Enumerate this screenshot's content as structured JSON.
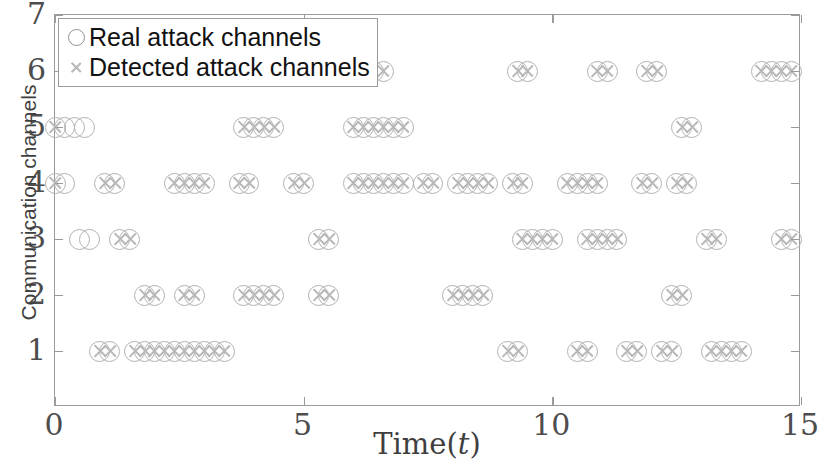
{
  "chart_data": {
    "type": "scatter",
    "title": "",
    "xlabel": "Time(t)",
    "ylabel": "Communication channels",
    "xlim": [
      0,
      15
    ],
    "ylim": [
      0,
      7
    ],
    "xticks": [
      0,
      5,
      10,
      15
    ],
    "yticks": [
      1,
      2,
      3,
      4,
      5,
      6,
      7
    ],
    "grid": false,
    "legend_position": "top-left",
    "legend": [
      {
        "name": "Real attack channels",
        "marker": "circle"
      },
      {
        "name": "Detected attack channels",
        "marker": "x"
      }
    ],
    "series": [
      {
        "name": "Real attack channels",
        "marker": "circle",
        "color": "#b2b2b2",
        "points": [
          {
            "x": 0.0,
            "y": 5
          },
          {
            "x": 0.2,
            "y": 5
          },
          {
            "x": 0.4,
            "y": 5
          },
          {
            "x": 0.6,
            "y": 5
          },
          {
            "x": 0.0,
            "y": 4
          },
          {
            "x": 0.2,
            "y": 4
          },
          {
            "x": 0.5,
            "y": 3
          },
          {
            "x": 0.7,
            "y": 3
          },
          {
            "x": 1.3,
            "y": 3
          },
          {
            "x": 1.5,
            "y": 3
          },
          {
            "x": 0.9,
            "y": 1
          },
          {
            "x": 1.1,
            "y": 1
          },
          {
            "x": 1.0,
            "y": 4
          },
          {
            "x": 1.2,
            "y": 4
          },
          {
            "x": 1.8,
            "y": 2
          },
          {
            "x": 2.0,
            "y": 2
          },
          {
            "x": 1.6,
            "y": 1
          },
          {
            "x": 1.8,
            "y": 1
          },
          {
            "x": 2.0,
            "y": 1
          },
          {
            "x": 2.2,
            "y": 1
          },
          {
            "x": 2.4,
            "y": 1
          },
          {
            "x": 2.6,
            "y": 1
          },
          {
            "x": 2.8,
            "y": 1
          },
          {
            "x": 3.0,
            "y": 1
          },
          {
            "x": 3.2,
            "y": 1
          },
          {
            "x": 3.4,
            "y": 1
          },
          {
            "x": 2.4,
            "y": 4
          },
          {
            "x": 2.6,
            "y": 4
          },
          {
            "x": 2.8,
            "y": 4
          },
          {
            "x": 3.0,
            "y": 4
          },
          {
            "x": 2.6,
            "y": 2
          },
          {
            "x": 2.8,
            "y": 2
          },
          {
            "x": 3.8,
            "y": 5
          },
          {
            "x": 4.0,
            "y": 5
          },
          {
            "x": 4.2,
            "y": 5
          },
          {
            "x": 4.4,
            "y": 5
          },
          {
            "x": 3.7,
            "y": 4
          },
          {
            "x": 3.9,
            "y": 4
          },
          {
            "x": 3.8,
            "y": 2
          },
          {
            "x": 4.0,
            "y": 2
          },
          {
            "x": 4.2,
            "y": 2
          },
          {
            "x": 4.4,
            "y": 2
          },
          {
            "x": 5.5,
            "y": 6
          },
          {
            "x": 5.7,
            "y": 6
          },
          {
            "x": 4.8,
            "y": 4
          },
          {
            "x": 5.0,
            "y": 4
          },
          {
            "x": 5.3,
            "y": 3
          },
          {
            "x": 5.5,
            "y": 3
          },
          {
            "x": 5.3,
            "y": 2
          },
          {
            "x": 5.5,
            "y": 2
          },
          {
            "x": 6.4,
            "y": 6
          },
          {
            "x": 6.6,
            "y": 6
          },
          {
            "x": 6.0,
            "y": 5
          },
          {
            "x": 6.2,
            "y": 5
          },
          {
            "x": 6.4,
            "y": 5
          },
          {
            "x": 6.6,
            "y": 5
          },
          {
            "x": 6.8,
            "y": 5
          },
          {
            "x": 7.0,
            "y": 5
          },
          {
            "x": 6.0,
            "y": 4
          },
          {
            "x": 6.2,
            "y": 4
          },
          {
            "x": 6.4,
            "y": 4
          },
          {
            "x": 6.6,
            "y": 4
          },
          {
            "x": 6.8,
            "y": 4
          },
          {
            "x": 7.0,
            "y": 4
          },
          {
            "x": 7.4,
            "y": 4
          },
          {
            "x": 7.6,
            "y": 4
          },
          {
            "x": 8.1,
            "y": 4
          },
          {
            "x": 8.3,
            "y": 4
          },
          {
            "x": 8.5,
            "y": 4
          },
          {
            "x": 8.7,
            "y": 4
          },
          {
            "x": 8.0,
            "y": 2
          },
          {
            "x": 8.2,
            "y": 2
          },
          {
            "x": 8.4,
            "y": 2
          },
          {
            "x": 8.6,
            "y": 2
          },
          {
            "x": 9.3,
            "y": 6
          },
          {
            "x": 9.5,
            "y": 6
          },
          {
            "x": 9.2,
            "y": 4
          },
          {
            "x": 9.4,
            "y": 4
          },
          {
            "x": 9.4,
            "y": 3
          },
          {
            "x": 9.6,
            "y": 3
          },
          {
            "x": 9.8,
            "y": 3
          },
          {
            "x": 10.0,
            "y": 3
          },
          {
            "x": 9.1,
            "y": 1
          },
          {
            "x": 9.3,
            "y": 1
          },
          {
            "x": 10.9,
            "y": 6
          },
          {
            "x": 11.1,
            "y": 6
          },
          {
            "x": 10.3,
            "y": 4
          },
          {
            "x": 10.5,
            "y": 4
          },
          {
            "x": 10.7,
            "y": 4
          },
          {
            "x": 10.9,
            "y": 4
          },
          {
            "x": 10.7,
            "y": 3
          },
          {
            "x": 10.9,
            "y": 3
          },
          {
            "x": 11.1,
            "y": 3
          },
          {
            "x": 11.3,
            "y": 3
          },
          {
            "x": 10.5,
            "y": 1
          },
          {
            "x": 10.7,
            "y": 1
          },
          {
            "x": 11.9,
            "y": 6
          },
          {
            "x": 12.1,
            "y": 6
          },
          {
            "x": 11.8,
            "y": 4
          },
          {
            "x": 12.0,
            "y": 4
          },
          {
            "x": 11.5,
            "y": 1
          },
          {
            "x": 11.7,
            "y": 1
          },
          {
            "x": 12.2,
            "y": 1
          },
          {
            "x": 12.4,
            "y": 1
          },
          {
            "x": 12.6,
            "y": 5
          },
          {
            "x": 12.8,
            "y": 5
          },
          {
            "x": 12.5,
            "y": 4
          },
          {
            "x": 12.7,
            "y": 4
          },
          {
            "x": 12.4,
            "y": 2
          },
          {
            "x": 12.6,
            "y": 2
          },
          {
            "x": 13.1,
            "y": 3
          },
          {
            "x": 13.3,
            "y": 3
          },
          {
            "x": 13.2,
            "y": 1
          },
          {
            "x": 13.4,
            "y": 1
          },
          {
            "x": 13.6,
            "y": 1
          },
          {
            "x": 13.8,
            "y": 1
          },
          {
            "x": 14.2,
            "y": 6
          },
          {
            "x": 14.4,
            "y": 6
          },
          {
            "x": 14.6,
            "y": 6
          },
          {
            "x": 14.8,
            "y": 6
          },
          {
            "x": 14.6,
            "y": 3
          },
          {
            "x": 14.8,
            "y": 3
          }
        ]
      },
      {
        "name": "Detected attack channels",
        "marker": "x",
        "color": "#b8b8b8",
        "points": [
          {
            "x": 0.0,
            "y": 5
          },
          {
            "x": 0.0,
            "y": 4
          },
          {
            "x": 1.3,
            "y": 3
          },
          {
            "x": 1.5,
            "y": 3
          },
          {
            "x": 0.9,
            "y": 1
          },
          {
            "x": 1.1,
            "y": 1
          },
          {
            "x": 1.0,
            "y": 4
          },
          {
            "x": 1.2,
            "y": 4
          },
          {
            "x": 1.8,
            "y": 2
          },
          {
            "x": 2.0,
            "y": 2
          },
          {
            "x": 1.6,
            "y": 1
          },
          {
            "x": 1.8,
            "y": 1
          },
          {
            "x": 2.0,
            "y": 1
          },
          {
            "x": 2.2,
            "y": 1
          },
          {
            "x": 2.4,
            "y": 1
          },
          {
            "x": 2.6,
            "y": 1
          },
          {
            "x": 2.8,
            "y": 1
          },
          {
            "x": 3.0,
            "y": 1
          },
          {
            "x": 3.2,
            "y": 1
          },
          {
            "x": 3.4,
            "y": 1
          },
          {
            "x": 2.4,
            "y": 4
          },
          {
            "x": 2.6,
            "y": 4
          },
          {
            "x": 2.8,
            "y": 4
          },
          {
            "x": 3.0,
            "y": 4
          },
          {
            "x": 2.6,
            "y": 2
          },
          {
            "x": 2.8,
            "y": 2
          },
          {
            "x": 3.8,
            "y": 5
          },
          {
            "x": 4.0,
            "y": 5
          },
          {
            "x": 4.2,
            "y": 5
          },
          {
            "x": 4.4,
            "y": 5
          },
          {
            "x": 3.7,
            "y": 4
          },
          {
            "x": 3.9,
            "y": 4
          },
          {
            "x": 3.8,
            "y": 2
          },
          {
            "x": 4.0,
            "y": 2
          },
          {
            "x": 4.2,
            "y": 2
          },
          {
            "x": 4.4,
            "y": 2
          },
          {
            "x": 5.5,
            "y": 6
          },
          {
            "x": 5.7,
            "y": 6
          },
          {
            "x": 4.8,
            "y": 4
          },
          {
            "x": 5.0,
            "y": 4
          },
          {
            "x": 5.3,
            "y": 3
          },
          {
            "x": 5.5,
            "y": 3
          },
          {
            "x": 5.3,
            "y": 2
          },
          {
            "x": 5.5,
            "y": 2
          },
          {
            "x": 6.4,
            "y": 6
          },
          {
            "x": 6.6,
            "y": 6
          },
          {
            "x": 6.0,
            "y": 5
          },
          {
            "x": 6.2,
            "y": 5
          },
          {
            "x": 6.4,
            "y": 5
          },
          {
            "x": 6.6,
            "y": 5
          },
          {
            "x": 6.8,
            "y": 5
          },
          {
            "x": 7.0,
            "y": 5
          },
          {
            "x": 6.0,
            "y": 4
          },
          {
            "x": 6.2,
            "y": 4
          },
          {
            "x": 6.4,
            "y": 4
          },
          {
            "x": 6.6,
            "y": 4
          },
          {
            "x": 6.8,
            "y": 4
          },
          {
            "x": 7.0,
            "y": 4
          },
          {
            "x": 7.4,
            "y": 4
          },
          {
            "x": 7.6,
            "y": 4
          },
          {
            "x": 8.1,
            "y": 4
          },
          {
            "x": 8.3,
            "y": 4
          },
          {
            "x": 8.5,
            "y": 4
          },
          {
            "x": 8.7,
            "y": 4
          },
          {
            "x": 8.0,
            "y": 2
          },
          {
            "x": 8.2,
            "y": 2
          },
          {
            "x": 8.4,
            "y": 2
          },
          {
            "x": 8.6,
            "y": 2
          },
          {
            "x": 9.3,
            "y": 6
          },
          {
            "x": 9.5,
            "y": 6
          },
          {
            "x": 9.2,
            "y": 4
          },
          {
            "x": 9.4,
            "y": 4
          },
          {
            "x": 9.4,
            "y": 3
          },
          {
            "x": 9.6,
            "y": 3
          },
          {
            "x": 9.8,
            "y": 3
          },
          {
            "x": 10.0,
            "y": 3
          },
          {
            "x": 9.1,
            "y": 1
          },
          {
            "x": 9.3,
            "y": 1
          },
          {
            "x": 10.9,
            "y": 6
          },
          {
            "x": 11.1,
            "y": 6
          },
          {
            "x": 10.3,
            "y": 4
          },
          {
            "x": 10.5,
            "y": 4
          },
          {
            "x": 10.7,
            "y": 4
          },
          {
            "x": 10.9,
            "y": 4
          },
          {
            "x": 10.7,
            "y": 3
          },
          {
            "x": 10.9,
            "y": 3
          },
          {
            "x": 11.1,
            "y": 3
          },
          {
            "x": 11.3,
            "y": 3
          },
          {
            "x": 10.5,
            "y": 1
          },
          {
            "x": 10.7,
            "y": 1
          },
          {
            "x": 11.9,
            "y": 6
          },
          {
            "x": 12.1,
            "y": 6
          },
          {
            "x": 11.8,
            "y": 4
          },
          {
            "x": 12.0,
            "y": 4
          },
          {
            "x": 11.5,
            "y": 1
          },
          {
            "x": 11.7,
            "y": 1
          },
          {
            "x": 12.2,
            "y": 1
          },
          {
            "x": 12.4,
            "y": 1
          },
          {
            "x": 12.6,
            "y": 5
          },
          {
            "x": 12.8,
            "y": 5
          },
          {
            "x": 12.5,
            "y": 4
          },
          {
            "x": 12.7,
            "y": 4
          },
          {
            "x": 12.4,
            "y": 2
          },
          {
            "x": 12.6,
            "y": 2
          },
          {
            "x": 13.1,
            "y": 3
          },
          {
            "x": 13.3,
            "y": 3
          },
          {
            "x": 13.2,
            "y": 1
          },
          {
            "x": 13.4,
            "y": 1
          },
          {
            "x": 13.6,
            "y": 1
          },
          {
            "x": 13.8,
            "y": 1
          },
          {
            "x": 14.2,
            "y": 6
          },
          {
            "x": 14.4,
            "y": 6
          },
          {
            "x": 14.6,
            "y": 6
          },
          {
            "x": 14.8,
            "y": 6
          },
          {
            "x": 14.6,
            "y": 3
          },
          {
            "x": 14.8,
            "y": 3
          }
        ]
      }
    ]
  },
  "axis": {
    "x_title_main": "Time(",
    "x_title_var": "t",
    "x_title_end": ")",
    "y_title": "Communication channels"
  }
}
